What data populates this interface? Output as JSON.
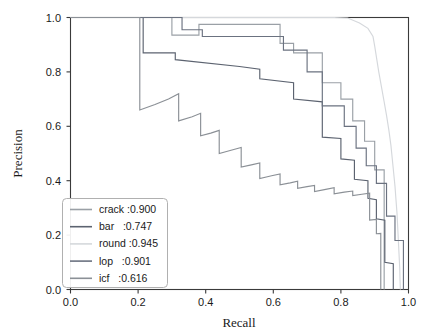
{
  "chart_data": {
    "type": "line",
    "title": "",
    "xlabel": "Recall",
    "ylabel": "Precision",
    "xlim": [
      0.0,
      1.0
    ],
    "ylim": [
      0.0,
      1.0
    ],
    "xticks": [
      "0.0",
      "0.2",
      "0.4",
      "0.6",
      "0.8",
      "1.0"
    ],
    "yticks": [
      "0.0",
      "0.2",
      "0.4",
      "0.6",
      "0.8",
      "1.0"
    ],
    "xtick_values": [
      0.0,
      0.2,
      0.4,
      0.6,
      0.8,
      1.0
    ],
    "ytick_values": [
      0.0,
      0.2,
      0.4,
      0.6,
      0.8,
      1.0
    ],
    "grid": false,
    "legend_position": "lower left",
    "series": [
      {
        "name": "crack",
        "ap": "0.900",
        "legend_label": "crack :0.900",
        "color": "#9aa0a6",
        "points": [
          [
            0.0,
            1.0
          ],
          [
            0.3,
            1.0
          ],
          [
            0.3,
            0.935
          ],
          [
            0.38,
            0.935
          ],
          [
            0.38,
            0.975
          ],
          [
            0.62,
            0.975
          ],
          [
            0.62,
            0.905
          ],
          [
            0.66,
            0.905
          ],
          [
            0.66,
            0.87
          ],
          [
            0.745,
            0.87
          ],
          [
            0.745,
            0.76
          ],
          [
            0.8,
            0.76
          ],
          [
            0.8,
            0.7
          ],
          [
            0.835,
            0.7
          ],
          [
            0.835,
            0.62
          ],
          [
            0.87,
            0.62
          ],
          [
            0.87,
            0.545
          ],
          [
            0.9,
            0.545
          ],
          [
            0.9,
            0.44
          ],
          [
            0.928,
            0.44
          ],
          [
            0.928,
            0.0
          ]
        ]
      },
      {
        "name": "bar",
        "ap": "0.747",
        "legend_label": "bar   :0.747",
        "color": "#5c6370",
        "points": [
          [
            0.0,
            1.0
          ],
          [
            0.215,
            1.0
          ],
          [
            0.215,
            0.87
          ],
          [
            0.31,
            0.87
          ],
          [
            0.31,
            0.845
          ],
          [
            0.5,
            0.82
          ],
          [
            0.56,
            0.81
          ],
          [
            0.56,
            0.775
          ],
          [
            0.66,
            0.76
          ],
          [
            0.66,
            0.7
          ],
          [
            0.745,
            0.69
          ],
          [
            0.745,
            0.56
          ],
          [
            0.8,
            0.555
          ],
          [
            0.8,
            0.48
          ],
          [
            0.84,
            0.475
          ],
          [
            0.84,
            0.405
          ],
          [
            0.88,
            0.4
          ],
          [
            0.88,
            0.335
          ],
          [
            0.905,
            0.33
          ],
          [
            0.905,
            0.26
          ],
          [
            0.93,
            0.255
          ],
          [
            0.93,
            0.1
          ],
          [
            0.955,
            0.095
          ],
          [
            0.955,
            0.0
          ]
        ]
      },
      {
        "name": "round",
        "ap": "0.945",
        "legend_label": "round :0.945",
        "color": "#d5d8dc",
        "points": [
          [
            0.0,
            1.0
          ],
          [
            0.78,
            1.0
          ],
          [
            0.82,
            0.998
          ],
          [
            0.855,
            0.98
          ],
          [
            0.88,
            0.96
          ],
          [
            0.895,
            0.93
          ],
          [
            0.9,
            0.895
          ],
          [
            0.905,
            0.855
          ],
          [
            0.912,
            0.8
          ],
          [
            0.92,
            0.745
          ],
          [
            0.928,
            0.69
          ],
          [
            0.935,
            0.64
          ],
          [
            0.942,
            0.585
          ],
          [
            0.948,
            0.53
          ],
          [
            0.952,
            0.48
          ],
          [
            0.956,
            0.43
          ],
          [
            0.96,
            0.38
          ],
          [
            0.963,
            0.33
          ],
          [
            0.966,
            0.28
          ],
          [
            0.968,
            0.23
          ],
          [
            0.97,
            0.18
          ],
          [
            0.972,
            0.13
          ],
          [
            0.974,
            0.08
          ],
          [
            0.975,
            0.03
          ],
          [
            0.976,
            0.0
          ]
        ]
      },
      {
        "name": "lop",
        "ap": "0.901",
        "legend_label": "lop   :0.901",
        "color": "#6b7280",
        "points": [
          [
            0.0,
            1.0
          ],
          [
            0.33,
            1.0
          ],
          [
            0.33,
            0.955
          ],
          [
            0.39,
            0.955
          ],
          [
            0.39,
            0.93
          ],
          [
            0.63,
            0.93
          ],
          [
            0.63,
            0.88
          ],
          [
            0.7,
            0.88
          ],
          [
            0.7,
            0.8
          ],
          [
            0.745,
            0.8
          ],
          [
            0.745,
            0.675
          ],
          [
            0.81,
            0.675
          ],
          [
            0.81,
            0.6
          ],
          [
            0.845,
            0.6
          ],
          [
            0.845,
            0.52
          ],
          [
            0.875,
            0.52
          ],
          [
            0.875,
            0.455
          ],
          [
            0.905,
            0.455
          ],
          [
            0.905,
            0.39
          ],
          [
            0.935,
            0.39
          ],
          [
            0.935,
            0.27
          ],
          [
            0.96,
            0.27
          ],
          [
            0.96,
            0.18
          ],
          [
            0.985,
            0.18
          ],
          [
            0.985,
            0.0
          ]
        ]
      },
      {
        "name": "icf",
        "ap": "0.616",
        "legend_label": "icf   :0.616",
        "color": "#8b9096",
        "points": [
          [
            0.0,
            1.0
          ],
          [
            0.205,
            1.0
          ],
          [
            0.205,
            0.66
          ],
          [
            0.25,
            0.68
          ],
          [
            0.29,
            0.7
          ],
          [
            0.32,
            0.72
          ],
          [
            0.32,
            0.62
          ],
          [
            0.36,
            0.635
          ],
          [
            0.385,
            0.648
          ],
          [
            0.385,
            0.565
          ],
          [
            0.415,
            0.575
          ],
          [
            0.44,
            0.585
          ],
          [
            0.44,
            0.5
          ],
          [
            0.475,
            0.512
          ],
          [
            0.505,
            0.522
          ],
          [
            0.505,
            0.45
          ],
          [
            0.535,
            0.458
          ],
          [
            0.56,
            0.465
          ],
          [
            0.56,
            0.408
          ],
          [
            0.595,
            0.418
          ],
          [
            0.62,
            0.425
          ],
          [
            0.62,
            0.385
          ],
          [
            0.65,
            0.392
          ],
          [
            0.672,
            0.398
          ],
          [
            0.672,
            0.372
          ],
          [
            0.7,
            0.378
          ],
          [
            0.722,
            0.383
          ],
          [
            0.722,
            0.36
          ],
          [
            0.755,
            0.368
          ],
          [
            0.78,
            0.374
          ],
          [
            0.78,
            0.352
          ],
          [
            0.81,
            0.358
          ],
          [
            0.835,
            0.362
          ],
          [
            0.835,
            0.345
          ],
          [
            0.862,
            0.35
          ],
          [
            0.885,
            0.354
          ],
          [
            0.885,
            0.255
          ],
          [
            0.905,
            0.258
          ],
          [
            0.905,
            0.205
          ],
          [
            0.918,
            0.206
          ],
          [
            0.918,
            0.0
          ]
        ]
      }
    ]
  },
  "axes": {
    "x_title": "Recall",
    "y_title": "Precision"
  },
  "legend": {
    "entries": [
      {
        "label": "crack :0.900"
      },
      {
        "label": "bar   :0.747"
      },
      {
        "label": "round :0.945"
      },
      {
        "label": "lop   :0.901"
      },
      {
        "label": "icf   :0.616"
      }
    ]
  }
}
